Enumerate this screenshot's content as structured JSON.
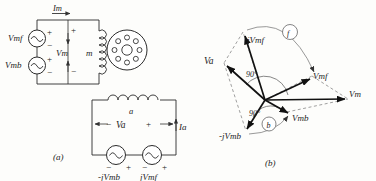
{
  "figure": {
    "caption_a": "(a)",
    "caption_b": "(b)",
    "panel_a": {
      "name": "two-phase-motor-circuit",
      "sources_upper": [
        {
          "label": "Vmf",
          "plus": "+",
          "minus": "−",
          "symbol": "ac-source"
        },
        {
          "label": "Vmb",
          "plus": "+",
          "minus": "−",
          "symbol": "ac-source"
        }
      ],
      "current_top": "Im",
      "branch_voltage": "Vm",
      "branch_plus": "+",
      "branch_minus": "−",
      "coil_main": "m",
      "coil_aux": "a",
      "aux_voltage": "Va",
      "aux_voltage_plus": "+",
      "aux_voltage_minus": "−",
      "aux_current": "Ia",
      "sources_lower": [
        {
          "label": "-jVmb",
          "minus": "−",
          "plus": "+",
          "symbol": "ac-source"
        },
        {
          "label": "jVmf",
          "minus": "−",
          "plus": "+",
          "symbol": "ac-source"
        }
      ],
      "rotor": {
        "name": "motor-cross-section",
        "bar_count": 8
      }
    },
    "panel_b": {
      "name": "phasor-diagram",
      "phasors": [
        {
          "label": "jVmf",
          "angle_deg": 72,
          "length": 72
        },
        {
          "label": "Va",
          "angle_deg": 131,
          "length": 62
        },
        {
          "label": "Vmf",
          "angle_deg": 13,
          "length": 80
        },
        {
          "label": "Vm",
          "angle_deg": 1,
          "length": 108
        },
        {
          "label": "Vmb",
          "angle_deg": -27,
          "length": 46
        },
        {
          "label": "-jVmb",
          "angle_deg": -108,
          "length": 62
        }
      ],
      "angle_marks": [
        {
          "text": "90°",
          "between": [
            "jVmf",
            "Vmf"
          ]
        },
        {
          "text": "90°",
          "between": [
            "Va",
            "Vmb"
          ]
        }
      ],
      "rotation_arcs": [
        {
          "label": "f",
          "sense": "forward"
        },
        {
          "label": "b",
          "sense": "backward"
        }
      ]
    }
  }
}
